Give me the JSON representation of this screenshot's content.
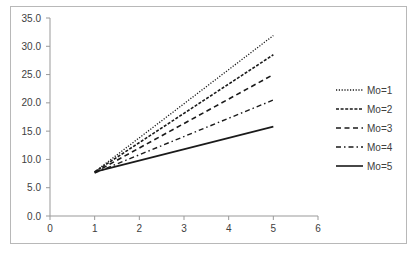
{
  "chart_data": {
    "type": "line",
    "title": "",
    "xlabel": "",
    "ylabel": "",
    "xlim": [
      0,
      6
    ],
    "ylim": [
      0,
      35
    ],
    "x_ticks": [
      "0",
      "1",
      "2",
      "3",
      "4",
      "5",
      "6"
    ],
    "y_ticks": [
      "0.0",
      "5.0",
      "10.0",
      "15.0",
      "20.0",
      "25.0",
      "30.0",
      "35.0"
    ],
    "grid": false,
    "legend_position": "right",
    "x": [
      1,
      5
    ],
    "series": [
      {
        "name": "Mo=1",
        "style": "dotted",
        "values": [
          7.8,
          31.9
        ]
      },
      {
        "name": "Mo=2",
        "style": "short-dash",
        "values": [
          7.8,
          28.5
        ]
      },
      {
        "name": "Mo=3",
        "style": "long-dash",
        "values": [
          7.7,
          25.0
        ]
      },
      {
        "name": "Mo=4",
        "style": "dash-dot",
        "values": [
          7.6,
          20.5
        ]
      },
      {
        "name": "Mo=5",
        "style": "solid",
        "values": [
          7.8,
          15.8
        ]
      }
    ]
  }
}
